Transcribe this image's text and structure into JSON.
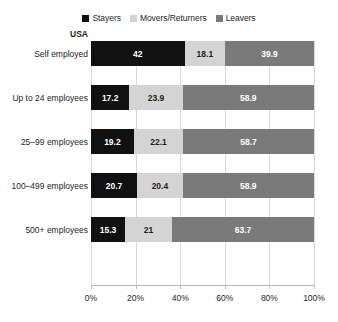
{
  "chart_data": {
    "type": "bar",
    "orientation": "horizontal",
    "stacked": true,
    "normalized": true,
    "title": "",
    "subtitle": "",
    "region_label": "USA",
    "xlabel": "",
    "ylabel": "",
    "xlim": [
      0,
      100
    ],
    "xticks": [
      0,
      20,
      40,
      60,
      80,
      100
    ],
    "xtick_labels": [
      "0%",
      "20%",
      "40%",
      "60%",
      "80%",
      "100%"
    ],
    "grid": true,
    "legend_position": "top-center",
    "categories": [
      "Self employed",
      "Up to 24 employees",
      "25–99 employees",
      "100–499 employees",
      "500+ employees"
    ],
    "series": [
      {
        "name": "Stayers",
        "color": "#111111",
        "label_color": "#ffffff",
        "values": [
          42,
          17.2,
          19.2,
          20.7,
          15.3
        ],
        "value_labels": [
          "42",
          "17.2",
          "19.2",
          "20.7",
          "15.3"
        ]
      },
      {
        "name": "Movers/Returners",
        "color": "#d4d4d4",
        "label_color": "#231f20",
        "values": [
          18.1,
          23.9,
          22.1,
          20.4,
          21
        ],
        "value_labels": [
          "18.1",
          "23.9",
          "22.1",
          "20.4",
          "21"
        ]
      },
      {
        "name": "Leavers",
        "color": "#7a7a7a",
        "label_color": "#ffffff",
        "values": [
          39.9,
          58.9,
          58.7,
          58.9,
          63.7
        ],
        "value_labels": [
          "39.9",
          "58.9",
          "58.7",
          "58.9",
          "63.7"
        ]
      }
    ]
  },
  "colors": {
    "background": "#ffffff",
    "gridline": "#d9d9d9",
    "axis": "#b9b9b9",
    "text": "#231f20"
  }
}
